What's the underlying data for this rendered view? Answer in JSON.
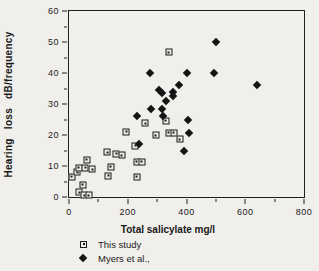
{
  "colors": {
    "background": "#f0efec",
    "marker": "#141414",
    "frame": "#1f1f1f",
    "text": "#1a1a1a"
  },
  "chart_data": {
    "type": "scatter",
    "title": "",
    "xlabel": "Total salicylate mg/l",
    "ylabel": "Hearing loss dB/frequency",
    "xlim": [
      0,
      800
    ],
    "ylim": [
      0,
      60
    ],
    "x_major_ticks": [
      0,
      200,
      400,
      600,
      800
    ],
    "x_minor_ticks": [
      100,
      300,
      500,
      700
    ],
    "y_major_ticks": [
      0,
      10,
      20,
      30,
      40,
      50,
      60
    ],
    "y_minor_ticks": [
      5,
      15,
      25,
      35,
      45,
      55
    ],
    "grid": false,
    "legend_position": "bottom-left",
    "series": [
      {
        "name": "This study",
        "marker": "open-square",
        "points": [
          [
            10,
            6.5
          ],
          [
            28,
            8
          ],
          [
            34,
            9.5
          ],
          [
            55,
            9.5
          ],
          [
            60,
            12
          ],
          [
            79,
            9
          ],
          [
            35,
            1.5
          ],
          [
            52,
            0.5
          ],
          [
            67,
            0.5
          ],
          [
            46,
            4
          ],
          [
            130,
            14.5
          ],
          [
            142,
            9.8
          ],
          [
            133,
            6.8
          ],
          [
            160,
            14
          ],
          [
            180,
            13.5
          ],
          [
            195,
            21
          ],
          [
            225,
            16.5
          ],
          [
            230,
            11.3
          ],
          [
            248,
            11.3
          ],
          [
            230,
            6.6
          ],
          [
            260,
            23.8
          ],
          [
            295,
            20
          ],
          [
            330,
            24.6
          ],
          [
            340,
            20.8
          ],
          [
            357,
            20.8
          ],
          [
            377,
            18.7
          ],
          [
            340,
            46.7
          ]
        ]
      },
      {
        "name": "Myers et al.,",
        "marker": "filled-diamond",
        "points": [
          [
            233,
            26
          ],
          [
            237,
            17
          ],
          [
            275,
            40
          ],
          [
            278,
            28.5
          ],
          [
            305,
            34.5
          ],
          [
            315,
            28.5
          ],
          [
            318,
            33.5
          ],
          [
            320,
            26
          ],
          [
            330,
            31
          ],
          [
            355,
            34
          ],
          [
            355,
            32.5
          ],
          [
            375,
            36
          ],
          [
            392,
            15
          ],
          [
            400,
            40
          ],
          [
            405,
            25
          ],
          [
            408,
            20.6
          ],
          [
            495,
            40
          ],
          [
            500,
            50
          ],
          [
            640,
            36
          ]
        ]
      }
    ]
  }
}
